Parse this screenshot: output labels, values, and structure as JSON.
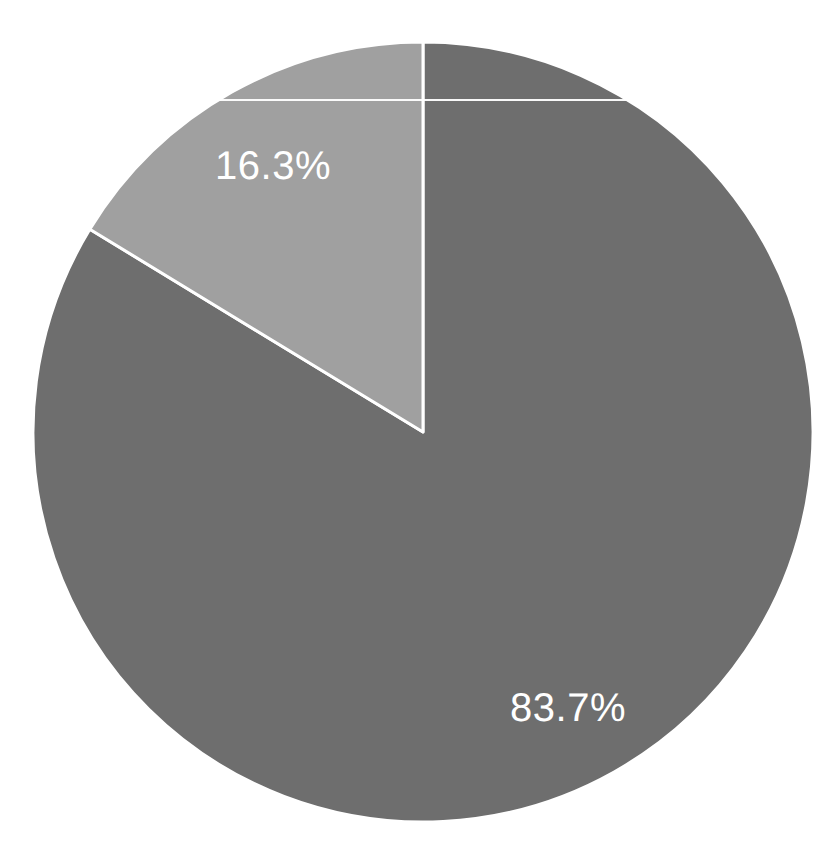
{
  "chart_data": {
    "type": "pie",
    "title": "",
    "subtitle": "",
    "xlabel": "",
    "ylabel": "",
    "categories": [
      "Majority share",
      "Minority share"
    ],
    "values": [
      83.7,
      16.3
    ],
    "labels": [
      "83.7%",
      "16.3%"
    ],
    "units": "percent",
    "total": 100.0,
    "legend": {
      "visible": false,
      "position": "none"
    },
    "grid": false,
    "start_angle_deg": 90,
    "direction": "clockwise",
    "slices": [
      {
        "name": "Majority share",
        "value": 83.7,
        "label": "83.7%",
        "color": "#6e6e6e",
        "start_angle_deg": 90,
        "end_angle_deg": -211.32,
        "sweep_deg": 301.32,
        "label_x": 568,
        "label_y": 708
      },
      {
        "name": "Minority share",
        "value": 16.3,
        "label": "16.3%",
        "color": "#a0a0a0",
        "start_angle_deg": 148.68,
        "end_angle_deg": 90,
        "sweep_deg": 58.68,
        "label_x": 273,
        "label_y": 166
      }
    ],
    "geometry": {
      "center_x": 423,
      "center_y": 432,
      "radius": 390,
      "wedge_edge_color": "#ffffff",
      "wedge_edge_width": 3
    },
    "colors": {
      "background": "#ffffff",
      "slice_dark": "#6e6e6e",
      "slice_light": "#a0a0a0",
      "label_text": "#ffffff",
      "edge": "#ffffff"
    },
    "artifacts": {
      "scanline_y": 99,
      "scanline_color": "#ffffff"
    }
  }
}
